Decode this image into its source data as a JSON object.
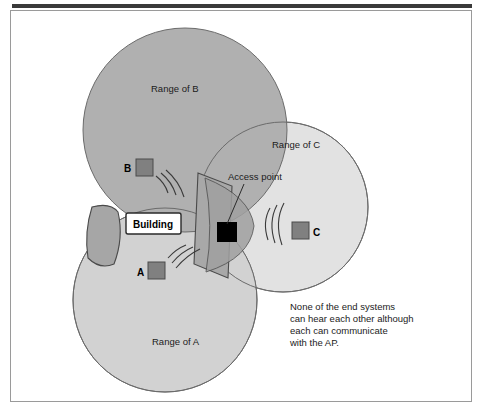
{
  "figure": {
    "caption_lines": [
      "None of the end systems",
      "can hear each other although",
      "each can communicate",
      "with the AP."
    ],
    "labels": {
      "range_b": "Range of B",
      "range_a": "Range of A",
      "range_c": "Range of C",
      "access_point": "Access point",
      "building": "Building",
      "station_a": "A",
      "station_b": "B",
      "station_c": "C"
    },
    "colors": {
      "range_b_fill": "#b0b0b0",
      "range_a_fill": "#d2d2d2",
      "range_c_fill": "#e2e2e2",
      "overlap_fill": "#b0b0b0",
      "circle_stroke": "#6b6b6b",
      "station_fill": "#808080",
      "station_stroke": "#4a4a4a",
      "access_point_fill": "#000000",
      "building_fill": "#ffffff",
      "building_stroke": "#2a2a2a",
      "wall_fill": "#a6a6a6",
      "wall_stroke": "#4a4a4a",
      "frame_stroke": "#9a9a9a",
      "top_bar": "#3a3a3a",
      "text": "#1b1b1b",
      "background": "#ffffff"
    },
    "geometry": {
      "range_b": {
        "cx": 185,
        "cy": 130,
        "r": 102
      },
      "range_a": {
        "cx": 165,
        "cy": 300,
        "r": 92
      },
      "range_c": {
        "cx": 283,
        "cy": 207,
        "r": 85
      },
      "access_point": {
        "x": 217,
        "y": 222,
        "w": 20,
        "h": 20
      },
      "station_a": {
        "x": 148,
        "y": 262,
        "w": 17,
        "h": 17
      },
      "station_b": {
        "x": 136,
        "y": 159,
        "w": 17,
        "h": 17
      },
      "station_c": {
        "x": 292,
        "y": 222,
        "w": 17,
        "h": 17
      },
      "building_box": {
        "x": 126,
        "y": 213,
        "w": 55,
        "h": 21
      }
    }
  }
}
